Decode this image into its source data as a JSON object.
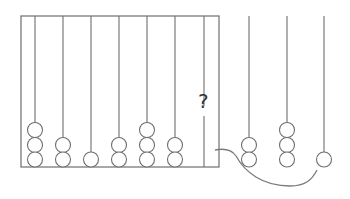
{
  "diagram": {
    "type": "abacus-puzzle",
    "question_mark": "?",
    "left_abacus": {
      "rods": [
        {
          "index": 1,
          "beads": 3
        },
        {
          "index": 2,
          "beads": 2
        },
        {
          "index": 3,
          "beads": 1
        },
        {
          "index": 4,
          "beads": 2
        },
        {
          "index": 5,
          "beads": 3
        },
        {
          "index": 6,
          "beads": 2
        },
        {
          "index": 7,
          "beads": null,
          "label": "?"
        }
      ]
    },
    "options": {
      "rods": [
        {
          "index": 1,
          "beads": 2
        },
        {
          "index": 2,
          "beads": 3
        },
        {
          "index": 3,
          "beads": 1
        }
      ]
    },
    "connector": "curved line from the question rod to the options"
  }
}
